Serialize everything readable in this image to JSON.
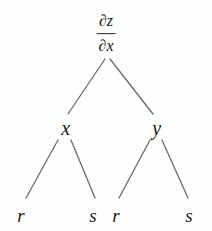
{
  "diagram": {
    "type": "tree",
    "edge_color": "#6b6b6b",
    "text_color": "#1a1a1a",
    "background": "#fefefe",
    "root": {
      "label": "∂z/∂x",
      "numerator": "∂z",
      "denominator": "∂x",
      "x": 106,
      "y": 34
    },
    "level2": [
      {
        "label": "x",
        "x": 66,
        "y": 128
      },
      {
        "label": "y",
        "x": 157,
        "y": 128
      }
    ],
    "leaves": [
      {
        "label": "r",
        "x": 21,
        "y": 215
      },
      {
        "label": "s",
        "x": 93,
        "y": 215
      },
      {
        "label": "r",
        "x": 116,
        "y": 215
      },
      {
        "label": "s",
        "x": 189,
        "y": 215
      }
    ],
    "edges": [
      {
        "from": "root",
        "to": "x",
        "x1": 105,
        "y1": 59,
        "x2": 68,
        "y2": 114
      },
      {
        "from": "root",
        "to": "y",
        "x1": 110,
        "y1": 59,
        "x2": 153,
        "y2": 114
      },
      {
        "from": "x",
        "to": "r1",
        "x1": 58,
        "y1": 140,
        "x2": 26,
        "y2": 198
      },
      {
        "from": "x",
        "to": "s1",
        "x1": 71,
        "y1": 140,
        "x2": 95,
        "y2": 198
      },
      {
        "from": "y",
        "to": "r2",
        "x1": 150,
        "y1": 140,
        "x2": 119,
        "y2": 198
      },
      {
        "from": "y",
        "to": "s2",
        "x1": 162,
        "y1": 140,
        "x2": 188,
        "y2": 198
      }
    ]
  }
}
